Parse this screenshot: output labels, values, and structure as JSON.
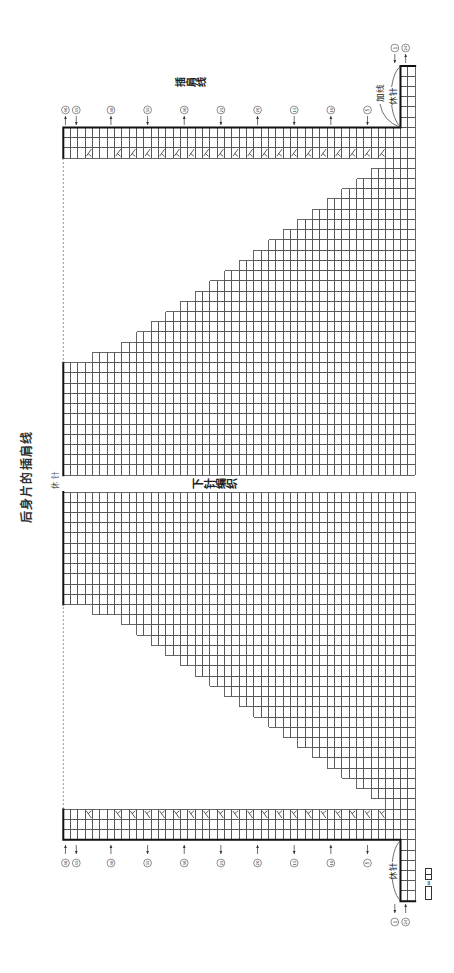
{
  "title": "后身片的插肩线",
  "annotations": {
    "raglan_line": "插肩线",
    "join_yarn": "加线",
    "hold_stitches_top": "休针",
    "hold_stitches_bottom": "休针",
    "hold_stitches_neck": "休针",
    "stockinette": "下针编织"
  },
  "legend": {
    "blank_symbol": "□",
    "equals": "=",
    "knit_symbol": "⊟"
  },
  "knitting_chart": {
    "rows": 46,
    "prev_rows": 2,
    "stitches_per_half": 40,
    "held_each_side": 6,
    "edge_strip": 3,
    "decrease_rows": [
      3,
      5,
      7,
      9,
      11,
      13,
      15,
      17,
      19,
      21,
      23,
      25,
      27,
      29,
      31,
      33,
      35,
      37,
      39,
      43
    ],
    "decrease_mark": "人",
    "colors": {
      "grid": "#555555",
      "outline": "#111111",
      "dashed": "#777777",
      "mark": "#333333"
    }
  },
  "row_labels": [
    {
      "row": 0,
      "num": "24",
      "dir": "up"
    },
    {
      "row": 1,
      "num": "1",
      "dir": "down"
    },
    {
      "row": 5,
      "num": "5",
      "dir": "down"
    },
    {
      "row": 10,
      "num": "10",
      "dir": "up"
    },
    {
      "row": 15,
      "num": "15",
      "dir": "down"
    },
    {
      "row": 20,
      "num": "20",
      "dir": "up"
    },
    {
      "row": 25,
      "num": "25",
      "dir": "down"
    },
    {
      "row": 30,
      "num": "30",
      "dir": "up"
    },
    {
      "row": 35,
      "num": "35",
      "dir": "down"
    },
    {
      "row": 40,
      "num": "40",
      "dir": "up"
    },
    {
      "row": 45,
      "num": "45",
      "dir": "down"
    },
    {
      "row": 46,
      "num": "46",
      "dir": "up"
    }
  ]
}
